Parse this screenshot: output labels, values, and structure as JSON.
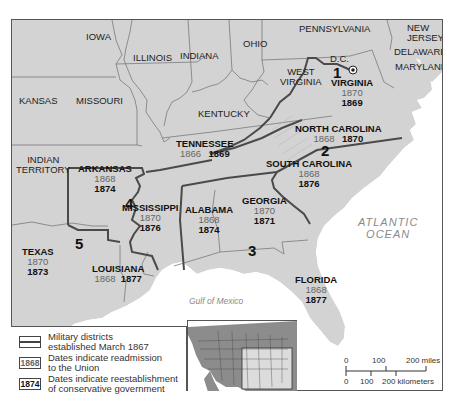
{
  "states_other": [
    {
      "id": "iowa",
      "name": "IOWA"
    },
    {
      "id": "illinois",
      "name": "ILLINOIS"
    },
    {
      "id": "indiana",
      "name": "INDIANA"
    },
    {
      "id": "ohio",
      "name": "OHIO"
    },
    {
      "id": "pennsylvania",
      "name": "PENNSYLVANIA"
    },
    {
      "id": "new-jersey",
      "name": "NEW\nJERSEY"
    },
    {
      "id": "delaware",
      "name": "DELAWARE"
    },
    {
      "id": "maryland",
      "name": "MARYLAND"
    },
    {
      "id": "kansas",
      "name": "KANSAS"
    },
    {
      "id": "missouri",
      "name": "MISSOURI"
    },
    {
      "id": "kentucky",
      "name": "KENTUCKY"
    },
    {
      "id": "west-virginia",
      "name": "WEST\nVIRGINIA"
    },
    {
      "id": "indian-territory",
      "name": "INDIAN\nTERRITORY"
    },
    {
      "id": "dc",
      "name": "D.C."
    }
  ],
  "confederate_states": [
    {
      "id": "virginia",
      "name": "VIRGINIA",
      "readmission": "1870",
      "conservative": "1869"
    },
    {
      "id": "north-carolina",
      "name": "NORTH CAROLINA",
      "readmission": "1868",
      "conservative": "1870"
    },
    {
      "id": "south-carolina",
      "name": "SOUTH CAROLINA",
      "readmission": "1868",
      "conservative": "1876"
    },
    {
      "id": "tennessee",
      "name": "TENNESSEE",
      "readmission": "1866",
      "conservative": "1869"
    },
    {
      "id": "arkansas",
      "name": "ARKANSAS",
      "readmission": "1868",
      "conservative": "1874"
    },
    {
      "id": "mississippi",
      "name": "MISSISSIPPI",
      "readmission": "1870",
      "conservative": "1876"
    },
    {
      "id": "alabama",
      "name": "ALABAMA",
      "readmission": "1868",
      "conservative": "1874"
    },
    {
      "id": "georgia",
      "name": "GEORGIA",
      "readmission": "1870",
      "conservative": "1871"
    },
    {
      "id": "texas",
      "name": "TEXAS",
      "readmission": "1870",
      "conservative": "1873"
    },
    {
      "id": "louisiana",
      "name": "LOUISIANA",
      "readmission": "1868",
      "conservative": "1877"
    },
    {
      "id": "florida",
      "name": "FLORIDA",
      "readmission": "1868",
      "conservative": "1877"
    }
  ],
  "districts": [
    "1",
    "2",
    "3",
    "4",
    "5"
  ],
  "water": {
    "atlantic": "ATLANTIC\nOCEAN",
    "gulf": "Gulf of Mexico"
  },
  "legend": {
    "districts_label": "Military districts\nestablished March 1867",
    "readmission_sample": "1868",
    "readmission_label": "Dates indicate readmission\nto the Union",
    "conservative_sample": "1874",
    "conservative_label": "Dates indicate reestablishment\nof conservative government"
  },
  "scale": {
    "miles_ticks": [
      "0",
      "100",
      "200 miles"
    ],
    "km_ticks": [
      "0",
      "100",
      "200 kilometers"
    ]
  },
  "colors": {
    "land": "#d3d3d3",
    "water": "#ffffff",
    "district_border": "#4a4a4a",
    "state_border": "#7a7a7a",
    "readmission_text": "#666666",
    "conservative_text": "#111111"
  }
}
